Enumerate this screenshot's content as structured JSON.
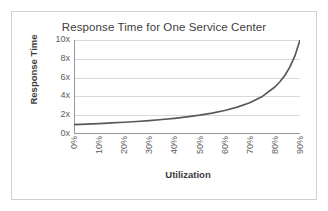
{
  "chart_data": {
    "type": "line",
    "title": "Response Time for One Service Center",
    "xlabel": "Utilization",
    "ylabel": "Response Time",
    "grid": true,
    "legend": false,
    "line_color": "#595959",
    "gridline_color": "#d9d9d9",
    "axis_color": "#9a9a9a",
    "x": [
      0,
      10,
      20,
      30,
      40,
      50,
      60,
      70,
      80,
      90
    ],
    "xticklabels": [
      "0%",
      "10%",
      "20%",
      "30%",
      "40%",
      "50%",
      "60%",
      "70%",
      "80%",
      "90%"
    ],
    "xlim": [
      0,
      90
    ],
    "yticks": [
      0,
      2,
      4,
      6,
      8,
      10
    ],
    "yticklabels": [
      "0x",
      "2x",
      "4x",
      "6x",
      "8x",
      "10x"
    ],
    "ylim": [
      0,
      10
    ],
    "series": [
      {
        "name": "Response Time",
        "formula": "1 / (1 - utilization)",
        "x": [
          0,
          5,
          10,
          15,
          20,
          25,
          30,
          35,
          40,
          45,
          50,
          55,
          60,
          65,
          70,
          75,
          80,
          82,
          84,
          86,
          88,
          90
        ],
        "values": [
          1.0,
          1.05,
          1.11,
          1.18,
          1.25,
          1.33,
          1.43,
          1.54,
          1.67,
          1.82,
          2.0,
          2.22,
          2.5,
          2.86,
          3.33,
          4.0,
          5.0,
          5.56,
          6.25,
          7.14,
          8.33,
          10.0
        ]
      }
    ]
  }
}
